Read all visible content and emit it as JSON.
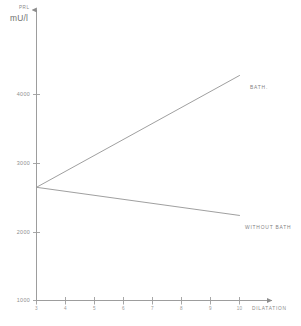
{
  "chart_data": {
    "type": "line",
    "title": "",
    "subtitle": "",
    "ylabel": "PRL",
    "yunit": "mU/l",
    "xlabel": "DILATATION",
    "ylim": [
      1000,
      4600
    ],
    "xlim": [
      3,
      11.4
    ],
    "grid": false,
    "legend_position": "inline-right-of-line-end",
    "yticks": [
      1000,
      2000,
      3000,
      4000
    ],
    "ytick_labels": [
      "1000",
      "2000",
      "3000",
      "4000"
    ],
    "xticks": [
      3,
      4,
      5,
      6,
      7,
      8,
      9,
      10
    ],
    "xtick_labels": [
      "3",
      "4",
      "5",
      "6",
      "7",
      "8",
      "9",
      "10"
    ],
    "x": [
      3,
      10
    ],
    "series": [
      {
        "name": "BATH",
        "label": "BATH.",
        "values": [
          2650,
          4280
        ],
        "color": "#9a9a9a"
      },
      {
        "name": "WITHOUT BATH",
        "label": "WITHOUT BATH",
        "values": [
          2650,
          2240
        ],
        "color": "#9a9a9a"
      }
    ]
  },
  "axes": {
    "y_name": "PRL",
    "y_unit": "mU/l",
    "x_name": "DILATATION",
    "ytick_labels": [
      "4000",
      "3000",
      "2000",
      "1000"
    ],
    "xtick_labels": [
      "3",
      "4",
      "5",
      "6",
      "7",
      "8",
      "9",
      "10"
    ]
  },
  "annotations": {
    "bath": "BATH.",
    "without_bath": "WITHOUT BATH"
  },
  "colors": {
    "axis": "#9d9d9d",
    "line": "#9a9a9a",
    "text": "#8a8a8a",
    "background": "#ffffff"
  }
}
